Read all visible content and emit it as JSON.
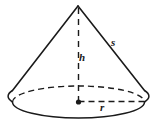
{
  "figure": {
    "name": "cone-diagram",
    "background_color": "#ffffff",
    "stroke_color": "#1a1a1a",
    "labels": {
      "height": "h",
      "slant": "s",
      "radius": "r"
    },
    "geometry": {
      "apex": {
        "x": 78,
        "y": 6
      },
      "base_center": {
        "x": 78.5,
        "y": 102
      },
      "base_ellipse": {
        "cx": 78.5,
        "cy": 102,
        "rx": 66,
        "ry": 16
      },
      "left_base_point": {
        "x": 12.5,
        "y": 90
      },
      "right_base_point": {
        "x": 144.5,
        "y": 90
      },
      "radius_endpoint": {
        "x": 144.5,
        "y": 102
      }
    },
    "elements": {
      "apex_point_label": "apex",
      "center_dot_label": "base-center-dot",
      "left_slant_label": "left-slant-edge",
      "right_slant_label": "right-slant-edge",
      "height_line_label": "height-dashed-line",
      "radius_line_label": "radius-dashed-line",
      "front_arc_label": "base-front-arc",
      "back_arc_label": "base-back-arc-dashed"
    }
  }
}
